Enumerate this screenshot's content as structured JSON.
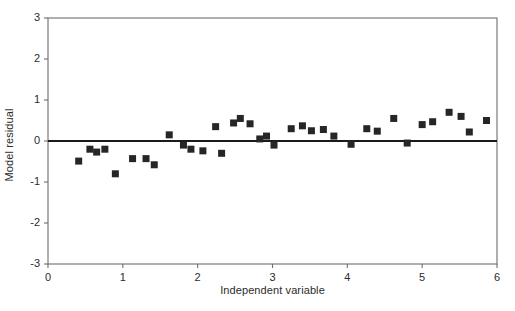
{
  "chart_data": {
    "type": "scatter",
    "title": "",
    "subtitle": "",
    "xlabel": "Independent variable",
    "ylabel": "Model residual",
    "xlim": [
      0,
      6
    ],
    "ylim": [
      -3,
      3
    ],
    "xticks": [
      0,
      1,
      2,
      3,
      4,
      5,
      6
    ],
    "xtick_labels": [
      "0",
      "1",
      "2",
      "3",
      "4",
      "5",
      "6"
    ],
    "yticks": [
      -3,
      -2,
      -1,
      0,
      1,
      2,
      3
    ],
    "ytick_labels": [
      "-3",
      "-2",
      "-1",
      "0",
      "1",
      "2",
      "3"
    ],
    "grid": false,
    "legend": null,
    "legend_position": "none",
    "marker": "square",
    "marker_color": "#262626",
    "marker_size_px": 7,
    "reference_line": {
      "name": "zero-residual-line",
      "orientation": "horizontal",
      "y": 0,
      "color": "#1a1a1a",
      "width_px": 2
    },
    "axis_color": "#6e6e6e",
    "frame": "box",
    "series": [
      {
        "name": "residuals",
        "points": [
          [
            0.41,
            -0.49
          ],
          [
            0.56,
            -0.2
          ],
          [
            0.65,
            -0.27
          ],
          [
            0.76,
            -0.2
          ],
          [
            0.9,
            -0.8
          ],
          [
            1.13,
            -0.43
          ],
          [
            1.31,
            -0.43
          ],
          [
            1.42,
            -0.58
          ],
          [
            1.62,
            0.15
          ],
          [
            1.81,
            -0.1
          ],
          [
            1.91,
            -0.2
          ],
          [
            2.07,
            -0.24
          ],
          [
            2.24,
            0.35
          ],
          [
            2.32,
            -0.3
          ],
          [
            2.48,
            0.44
          ],
          [
            2.57,
            0.55
          ],
          [
            2.7,
            0.42
          ],
          [
            2.83,
            0.05
          ],
          [
            2.92,
            0.12
          ],
          [
            3.02,
            -0.1
          ],
          [
            3.25,
            0.3
          ],
          [
            3.4,
            0.37
          ],
          [
            3.52,
            0.25
          ],
          [
            3.68,
            0.28
          ],
          [
            3.82,
            0.12
          ],
          [
            4.05,
            -0.08
          ],
          [
            4.26,
            0.3
          ],
          [
            4.4,
            0.24
          ],
          [
            4.62,
            0.55
          ],
          [
            4.8,
            -0.05
          ],
          [
            5.0,
            0.4
          ],
          [
            5.14,
            0.47
          ],
          [
            5.36,
            0.7
          ],
          [
            5.52,
            0.6
          ],
          [
            5.63,
            0.22
          ],
          [
            5.86,
            0.5
          ]
        ]
      }
    ]
  }
}
